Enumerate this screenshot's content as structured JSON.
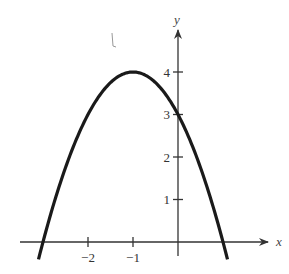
{
  "chart_data": {
    "type": "line",
    "title": "",
    "function": "y = -(x+1)^2 + 4",
    "xlabel": "x",
    "ylabel": "y",
    "xlim": [
      -3.3,
      2.0
    ],
    "ylim": [
      -0.5,
      4.9
    ],
    "grid": false,
    "legend": null,
    "x_ticks": [
      -2,
      -1
    ],
    "x_tick_labels": [
      "−2",
      "−1"
    ],
    "y_ticks": [
      1,
      2,
      3,
      4
    ],
    "y_tick_labels": [
      "1",
      "2",
      "3",
      "4"
    ],
    "series": [
      {
        "name": "parabola",
        "x": [
          -3.1,
          -3,
          -2.5,
          -2,
          -1.5,
          -1,
          -0.5,
          0,
          0.5,
          1,
          1.1
        ],
        "y": [
          -0.41,
          0,
          1.75,
          3,
          3.75,
          4,
          3.75,
          3,
          1.75,
          0,
          -0.41
        ]
      }
    ],
    "key_points": {
      "vertex": [
        -1,
        4
      ],
      "y_intercept": [
        0,
        3
      ],
      "x_intercepts": [
        [
          -3,
          0
        ],
        [
          1,
          0
        ]
      ]
    }
  },
  "labels": {
    "x_axis": "x",
    "y_axis": "y",
    "stray_mark": "l"
  }
}
